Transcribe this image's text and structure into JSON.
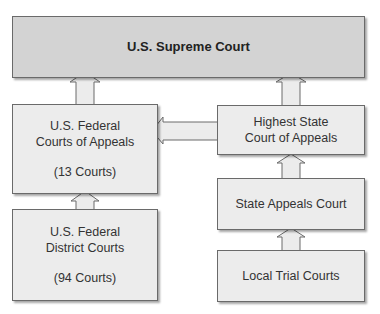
{
  "diagram": {
    "nodes": {
      "supreme": {
        "label": "U.S. Supreme Court"
      },
      "federal_appeals": {
        "line1": "U.S. Federal",
        "line2": "Courts of Appeals",
        "count": "(13 Courts)"
      },
      "federal_district": {
        "line1": "U.S. Federal",
        "line2": "District Courts",
        "count": "(94 Courts)"
      },
      "highest_state": {
        "line1": "Highest State",
        "line2": "Court of Appeals"
      },
      "state_appeals": {
        "label": "State Appeals Court"
      },
      "local_trial": {
        "label": "Local Trial Courts"
      }
    },
    "edges": [
      {
        "from": "federal_appeals",
        "to": "supreme"
      },
      {
        "from": "highest_state",
        "to": "supreme"
      },
      {
        "from": "highest_state",
        "to": "federal_appeals"
      },
      {
        "from": "federal_district",
        "to": "federal_appeals"
      },
      {
        "from": "state_appeals",
        "to": "highest_state"
      },
      {
        "from": "local_trial",
        "to": "state_appeals"
      }
    ],
    "colors": {
      "top_box": "#d3d3d3",
      "box": "#ececec",
      "border": "#6a6a6a"
    }
  }
}
